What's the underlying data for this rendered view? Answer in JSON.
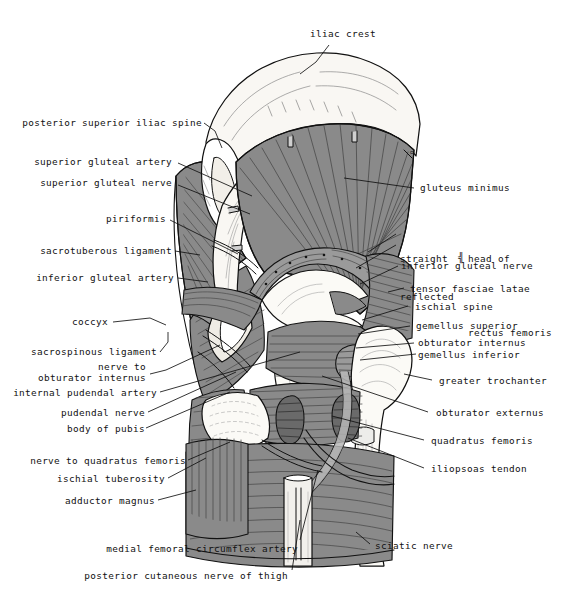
{
  "figure": {
    "kind": "anatomical-illustration",
    "colors": {
      "background": "#ffffff",
      "ink": "#111111",
      "muscle_fill": "#8a8a8a",
      "muscle_fill_dark": "#6f6f6f",
      "muscle_fill_light": "#a3a3a3",
      "bone_fill": "#f7f5f0",
      "tendon_fill": "#ededea",
      "vessel_fill": "#5a5a5a"
    },
    "corner_mark": "ᴑ"
  },
  "labels": {
    "top": [
      {
        "id": "iliac-crest",
        "text": "iliac crest"
      }
    ],
    "left": [
      {
        "id": "posterior-superior-iliac-spine",
        "text": "posterior superior iliac spine"
      },
      {
        "id": "superior-gluteal-artery",
        "text": "superior gluteal artery"
      },
      {
        "id": "superior-gluteal-nerve",
        "text": "superior gluteal nerve"
      },
      {
        "id": "piriformis",
        "text": "piriformis"
      },
      {
        "id": "sacrotuberous-ligament",
        "text": "sacrotuberous ligament"
      },
      {
        "id": "inferior-gluteal-artery",
        "text": "inferior gluteal artery"
      },
      {
        "id": "coccyx",
        "text": "coccyx"
      },
      {
        "id": "sacrospinous-ligament",
        "text": "sacrospinous ligament"
      },
      {
        "id": "nerve-to-obturator-internus-line1",
        "text": "nerve to"
      },
      {
        "id": "nerve-to-obturator-internus-line2",
        "text": "obturator internus"
      },
      {
        "id": "internal-pudendal-artery",
        "text": "internal pudendal artery"
      },
      {
        "id": "pudendal-nerve",
        "text": "pudendal nerve"
      },
      {
        "id": "body-of-pubis",
        "text": "body of pubis"
      },
      {
        "id": "nerve-to-quadratus-femoris",
        "text": "nerve to quadratus femoris"
      },
      {
        "id": "ischial-tuberosity",
        "text": "ischial tuberosity"
      },
      {
        "id": "adductor-magnus",
        "text": "adductor magnus"
      },
      {
        "id": "medial-femoral-circumflex-artery",
        "text": "medial femoral circumflex artery"
      },
      {
        "id": "posterior-cutaneous-nerve-of-thigh",
        "text": "posterior cutaneous nerve of thigh"
      }
    ],
    "right": [
      {
        "id": "gluteus-minimus",
        "text": "gluteus minimus"
      },
      {
        "id": "rectus-femoris-straight",
        "text": "straight"
      },
      {
        "id": "rectus-femoris-reflected",
        "text": "reflected"
      },
      {
        "id": "rectus-femoris-head-of",
        "text": "head of"
      },
      {
        "id": "rectus-femoris-name",
        "text": "rectus femoris"
      },
      {
        "id": "inferior-gluteal-nerve",
        "text": "inferior gluteal nerve"
      },
      {
        "id": "tensor-fasciae-latae",
        "text": "tensor fasciae latae"
      },
      {
        "id": "ischial-spine",
        "text": "ischial spine"
      },
      {
        "id": "gemellus-superior",
        "text": "gemellus superior"
      },
      {
        "id": "obturator-internus",
        "text": "obturator internus"
      },
      {
        "id": "gemellus-inferior",
        "text": "gemellus inferior"
      },
      {
        "id": "greater-trochanter",
        "text": "greater trochanter"
      },
      {
        "id": "obturator-externus",
        "text": "obturator externus"
      },
      {
        "id": "quadratus-femoris",
        "text": "quadratus femoris"
      },
      {
        "id": "iliopsoas-tendon",
        "text": "iliopsoas tendon"
      },
      {
        "id": "sciatic-nerve",
        "text": "sciatic nerve"
      }
    ]
  }
}
